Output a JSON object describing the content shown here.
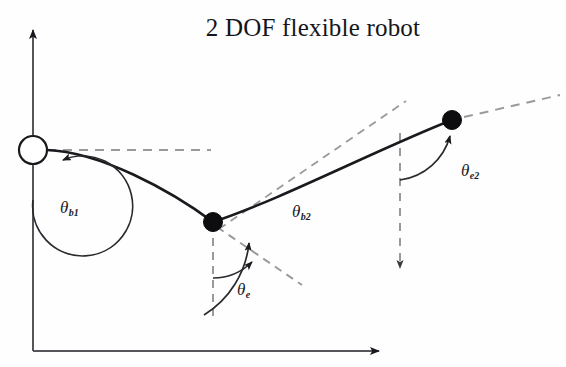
{
  "figure": {
    "title": "2 DOF flexible robot",
    "width": 566,
    "height": 367,
    "background_color": "#fefefe",
    "stroke_color": "#1a1a1e",
    "dashed_color": "#9a9a9a"
  },
  "axes": {
    "y_axis": {
      "name": "vertical-axis",
      "x": 33,
      "y_top": 22,
      "y_bottom": 351,
      "arrow": "up"
    },
    "x_axis": {
      "name": "horizontal-axis",
      "y": 351,
      "x_left": 33,
      "x_right": 388,
      "arrow": "right"
    }
  },
  "nodes": [
    {
      "id": "base-hub",
      "type": "open-circle",
      "x": 33,
      "y": 150,
      "radius": 14
    },
    {
      "id": "mid-joint",
      "type": "filled-circle",
      "x": 213,
      "y": 222,
      "radius": 9
    },
    {
      "id": "end-effector",
      "type": "filled-circle",
      "x": 452,
      "y": 120,
      "radius": 9
    }
  ],
  "links": [
    {
      "id": "link-1",
      "from": "base-hub",
      "to": "mid-joint",
      "shape": "curved-beam-downward"
    },
    {
      "id": "link-2",
      "from": "mid-joint",
      "to": "end-effector",
      "shape": "curved-beam-upward"
    }
  ],
  "reference_lines": [
    {
      "id": "base-horizontal-dashed",
      "from": [
        47,
        150
      ],
      "to": [
        210,
        150
      ],
      "style": "dashed"
    },
    {
      "id": "mid-vertical-dashed",
      "from": [
        213,
        222
      ],
      "to": [
        213,
        318
      ],
      "style": "dashed"
    },
    {
      "id": "mid-tangent-dashed",
      "from": [
        213,
        222
      ],
      "to": [
        300,
        283
      ],
      "style": "dashed"
    },
    {
      "id": "link2-tangent-dashed",
      "from": [
        219,
        228
      ],
      "to": [
        404,
        102
      ],
      "style": "dashed"
    },
    {
      "id": "end-vertical-dashed",
      "from": [
        400,
        133
      ],
      "to": [
        400,
        278
      ],
      "style": "dashed",
      "arrow": "down"
    },
    {
      "id": "end-tangent-dashed",
      "from": [
        452,
        120
      ],
      "to": [
        560,
        95
      ],
      "style": "dashed"
    }
  ],
  "angles": [
    {
      "id": "theta-b1",
      "symbol": "θ",
      "subscript": "b1",
      "label": "θb1",
      "description": "base link-1 angle measured from vertical axis"
    },
    {
      "id": "theta-b2",
      "symbol": "θ",
      "subscript": "b2",
      "label": "θb2",
      "description": "link-2 angle at mid joint"
    },
    {
      "id": "theta-e",
      "symbol": "θ",
      "subscript": "e",
      "label": "θe",
      "description": "elastic deflection angle at mid joint"
    },
    {
      "id": "theta-e2",
      "symbol": "θ",
      "subscript": "e2",
      "label": "θe2",
      "description": "elastic deflection angle at end effector"
    }
  ]
}
